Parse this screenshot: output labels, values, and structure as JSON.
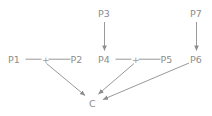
{
  "diagram": {
    "type": "path-diagram",
    "background_color": "#ffffff",
    "line_color": "#8d8d8d",
    "text_color": "#8d8d8d",
    "nodes": [
      {
        "id": "P1",
        "label": "P1",
        "x": 15,
        "y": 62
      },
      {
        "id": "P2",
        "label": "P2",
        "x": 77,
        "y": 62
      },
      {
        "id": "P3",
        "label": "P3",
        "x": 105,
        "y": 16
      },
      {
        "id": "P4",
        "label": "P4",
        "x": 105,
        "y": 62
      },
      {
        "id": "P5",
        "label": "P5",
        "x": 167,
        "y": 62
      },
      {
        "id": "P6",
        "label": "P6",
        "x": 197,
        "y": 62
      },
      {
        "id": "P7",
        "label": "P7",
        "x": 197,
        "y": 16
      },
      {
        "id": "C",
        "label": "C",
        "x": 92,
        "y": 105
      }
    ],
    "operators": [
      {
        "id": "plus-left",
        "label": "+",
        "x": 45,
        "y": 62
      },
      {
        "id": "plus-right",
        "label": "+",
        "x": 135,
        "y": 62
      }
    ],
    "connectors": [
      {
        "id": "p1-to-plus-left",
        "from": "P1",
        "to": "plus-left",
        "arrow": false
      },
      {
        "id": "plus-left-to-p2",
        "from": "plus-left",
        "to": "P2",
        "arrow": false
      },
      {
        "id": "p4-to-plus-right",
        "from": "P4",
        "to": "plus-right",
        "arrow": false
      },
      {
        "id": "plus-right-to-p5",
        "from": "plus-right",
        "to": "P5",
        "arrow": false
      },
      {
        "id": "p3-to-p4",
        "from": "P3",
        "to": "P4",
        "arrow": true
      },
      {
        "id": "p7-to-p6",
        "from": "P7",
        "to": "P6",
        "arrow": true
      },
      {
        "id": "plus-left-to-c",
        "from": "plus-left",
        "to": "C",
        "arrow": true
      },
      {
        "id": "plus-right-to-c",
        "from": "plus-right",
        "to": "C",
        "arrow": true
      },
      {
        "id": "p6-to-c",
        "from": "P6",
        "to": "C",
        "arrow": true
      }
    ]
  }
}
